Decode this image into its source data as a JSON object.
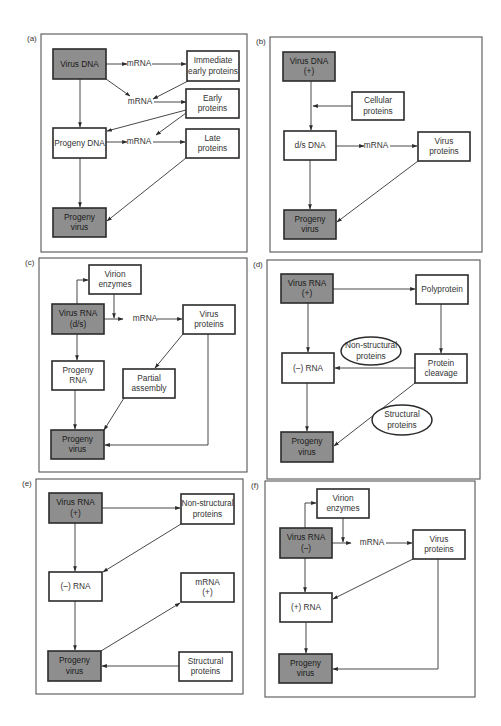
{
  "figure": {
    "colors": {
      "shaded_box": "#8e8e8e",
      "plain_box": "#ffffff",
      "stroke": "#2b2b2b"
    }
  },
  "panels": [
    {
      "id": "a",
      "tag": "(a)",
      "frame": [
        41,
        34,
        206,
        218
      ],
      "nodes": [
        {
          "id": "vdna",
          "type": "shaded",
          "x": 53,
          "y": 49,
          "w": 53,
          "h": 30,
          "lines": [
            "Virus DNA"
          ]
        },
        {
          "id": "m1",
          "type": "text",
          "x": 139,
          "y": 64,
          "lines": [
            "mRNA"
          ]
        },
        {
          "id": "iep",
          "type": "plain",
          "x": 187,
          "y": 51,
          "w": 52,
          "h": 30,
          "lines": [
            "Immediate",
            "early proteins"
          ]
        },
        {
          "id": "m2",
          "type": "text",
          "x": 140,
          "y": 102,
          "lines": [
            "mRNA"
          ]
        },
        {
          "id": "ep",
          "type": "plain",
          "x": 186,
          "y": 89,
          "w": 53,
          "h": 29,
          "lines": [
            "Early",
            "proteins"
          ]
        },
        {
          "id": "pdna",
          "type": "plain",
          "x": 53,
          "y": 128,
          "w": 53,
          "h": 30,
          "lines": [
            "Progeny DNA"
          ]
        },
        {
          "id": "m3",
          "type": "text",
          "x": 139,
          "y": 142,
          "lines": [
            "mRNA"
          ]
        },
        {
          "id": "lp",
          "type": "plain",
          "x": 186,
          "y": 129,
          "w": 53,
          "h": 29,
          "lines": [
            "Late",
            "proteins"
          ]
        },
        {
          "id": "pv",
          "type": "shaded",
          "x": 53,
          "y": 208,
          "w": 53,
          "h": 29,
          "lines": [
            "Progeny",
            "virus"
          ]
        }
      ],
      "edges": [
        [
          [
            106,
            64
          ],
          [
            127,
            64
          ]
        ],
        [
          [
            152,
            64
          ],
          [
            186,
            64
          ]
        ],
        [
          [
            106,
            79
          ],
          [
            130,
            96
          ]
        ],
        [
          [
            188,
            81
          ],
          [
            153,
            99
          ]
        ],
        [
          [
            154,
            102
          ],
          [
            186,
            102
          ]
        ],
        [
          [
            186,
            110
          ],
          [
            107,
            131
          ]
        ],
        [
          [
            186,
            113
          ],
          [
            156,
            135
          ]
        ],
        [
          [
            80,
            79
          ],
          [
            80,
            127
          ]
        ],
        [
          [
            106,
            142
          ],
          [
            127,
            142
          ]
        ],
        [
          [
            153,
            142
          ],
          [
            185,
            142
          ]
        ],
        [
          [
            80,
            158
          ],
          [
            80,
            207
          ]
        ],
        [
          [
            186,
            158
          ],
          [
            107,
            221
          ]
        ]
      ]
    },
    {
      "id": "b",
      "tag": "(b)",
      "frame": [
        270,
        37,
        212,
        215
      ],
      "nodes": [
        {
          "id": "vdna",
          "type": "shaded",
          "x": 283,
          "y": 52,
          "w": 52,
          "h": 29,
          "lines": [
            "Virus DNA",
            "(+)"
          ]
        },
        {
          "id": "cp",
          "type": "plain",
          "x": 352,
          "y": 92,
          "w": 52,
          "h": 28,
          "lines": [
            "Cellular",
            "proteins"
          ]
        },
        {
          "id": "dsdna",
          "type": "plain",
          "x": 284,
          "y": 131,
          "w": 52,
          "h": 29,
          "lines": [
            "d/s DNA"
          ]
        },
        {
          "id": "m1",
          "type": "text",
          "x": 376,
          "y": 146,
          "lines": [
            "mRNA"
          ]
        },
        {
          "id": "vp",
          "type": "plain",
          "x": 418,
          "y": 132,
          "w": 52,
          "h": 29,
          "lines": [
            "Virus",
            "proteins"
          ]
        },
        {
          "id": "pv",
          "type": "shaded",
          "x": 284,
          "y": 210,
          "w": 52,
          "h": 29,
          "lines": [
            "Progeny",
            "virus"
          ]
        }
      ],
      "edges": [
        [
          [
            311,
            81
          ],
          [
            311,
            130
          ]
        ],
        [
          [
            352,
            106
          ],
          [
            313,
            106
          ]
        ],
        [
          [
            336,
            146
          ],
          [
            364,
            146
          ]
        ],
        [
          [
            390,
            146
          ],
          [
            417,
            146
          ]
        ],
        [
          [
            310,
            160
          ],
          [
            310,
            209
          ]
        ],
        [
          [
            418,
            161
          ],
          [
            337,
            222
          ]
        ]
      ]
    },
    {
      "id": "c",
      "tag": "(c)",
      "frame": [
        39,
        258,
        208,
        214
      ],
      "nodes": [
        {
          "id": "ve",
          "type": "plain",
          "x": 89,
          "y": 265,
          "w": 52,
          "h": 29,
          "lines": [
            "Virion",
            "enzymes"
          ]
        },
        {
          "id": "vrna",
          "type": "shaded",
          "x": 52,
          "y": 304,
          "w": 52,
          "h": 30,
          "lines": [
            "Virus RNA",
            "(d/s)"
          ]
        },
        {
          "id": "m1",
          "type": "text",
          "x": 145,
          "y": 319,
          "lines": [
            "mRNA"
          ]
        },
        {
          "id": "vp",
          "type": "plain",
          "x": 183,
          "y": 305,
          "w": 52,
          "h": 29,
          "lines": [
            "Virus",
            "proteins"
          ]
        },
        {
          "id": "prna",
          "type": "plain",
          "x": 52,
          "y": 361,
          "w": 52,
          "h": 29,
          "lines": [
            "Progeny",
            "RNA"
          ]
        },
        {
          "id": "pa",
          "type": "plain",
          "x": 123,
          "y": 369,
          "w": 52,
          "h": 29,
          "lines": [
            "Partial",
            "assembly"
          ]
        },
        {
          "id": "pv",
          "type": "shaded",
          "x": 51,
          "y": 430,
          "w": 53,
          "h": 29,
          "lines": [
            "Progeny",
            "virus"
          ]
        }
      ],
      "edges": [
        [
          [
            77,
            304
          ],
          [
            77,
            280
          ],
          [
            88,
            280
          ]
        ],
        [
          [
            114,
            294
          ],
          [
            114,
            318
          ]
        ],
        [
          [
            104,
            319
          ],
          [
            123,
            319
          ]
        ],
        [
          [
            157,
            319
          ],
          [
            182,
            319
          ]
        ],
        [
          [
            77,
            334
          ],
          [
            77,
            360
          ]
        ],
        [
          [
            183,
            334
          ],
          [
            155,
            368
          ]
        ],
        [
          [
            75,
            390
          ],
          [
            75,
            429
          ]
        ],
        [
          [
            124,
            398
          ],
          [
            104,
            430
          ]
        ],
        [
          [
            208,
            334
          ],
          [
            208,
            445
          ],
          [
            105,
            445
          ]
        ]
      ]
    },
    {
      "id": "d",
      "tag": "(d)",
      "frame": [
        267,
        260,
        213,
        219
      ],
      "nodes": [
        {
          "id": "vrna",
          "type": "shaded",
          "x": 281,
          "y": 274,
          "w": 52,
          "h": 29,
          "lines": [
            "Virus RNA",
            "(+)"
          ]
        },
        {
          "id": "pp",
          "type": "plain",
          "x": 416,
          "y": 275,
          "w": 52,
          "h": 29,
          "lines": [
            "Polyprotein"
          ]
        },
        {
          "id": "nsp",
          "type": "ellipse",
          "cx": 371,
          "cy": 351,
          "rx": 30,
          "ry": 14,
          "lines": [
            "Non-structural",
            "proteins"
          ]
        },
        {
          "id": "mrna",
          "type": "plain",
          "x": 282,
          "y": 353,
          "w": 52,
          "h": 30,
          "lines": [
            "(–) RNA"
          ]
        },
        {
          "id": "pc",
          "type": "plain",
          "x": 415,
          "y": 354,
          "w": 52,
          "h": 29,
          "lines": [
            "Protein",
            "cleavage"
          ]
        },
        {
          "id": "sp",
          "type": "ellipse",
          "cx": 402,
          "cy": 420,
          "rx": 30,
          "ry": 15,
          "lines": [
            "Structural",
            "proteins"
          ]
        },
        {
          "id": "pv",
          "type": "shaded",
          "x": 281,
          "y": 432,
          "w": 52,
          "h": 30,
          "lines": [
            "Progeny",
            "virus"
          ]
        }
      ],
      "edges": [
        [
          [
            333,
            289
          ],
          [
            415,
            289
          ]
        ],
        [
          [
            441,
            304
          ],
          [
            441,
            353
          ]
        ],
        [
          [
            415,
            368
          ],
          [
            335,
            368
          ]
        ],
        [
          [
            308,
            303
          ],
          [
            308,
            352
          ]
        ],
        [
          [
            307,
            383
          ],
          [
            307,
            431
          ]
        ],
        [
          [
            415,
            383
          ],
          [
            334,
            446
          ]
        ]
      ]
    },
    {
      "id": "e",
      "tag": "(e)",
      "frame": [
        36,
        479,
        207,
        215
      ],
      "nodes": [
        {
          "id": "vrna",
          "type": "shaded",
          "x": 49,
          "y": 493,
          "w": 53,
          "h": 30,
          "lines": [
            "Virus RNA",
            "(+)"
          ]
        },
        {
          "id": "nsp",
          "type": "plain",
          "x": 181,
          "y": 494,
          "w": 53,
          "h": 30,
          "lines": [
            "Non-structural",
            "proteins"
          ]
        },
        {
          "id": "mrna",
          "type": "plain",
          "x": 49,
          "y": 572,
          "w": 53,
          "h": 29,
          "lines": [
            "(–) RNA"
          ]
        },
        {
          "id": "mrnap",
          "type": "plain",
          "x": 181,
          "y": 573,
          "w": 53,
          "h": 29,
          "lines": [
            "mRNA",
            "(+)"
          ]
        },
        {
          "id": "pv",
          "type": "shaded",
          "x": 48,
          "y": 651,
          "w": 53,
          "h": 30,
          "lines": [
            "Progeny",
            "virus"
          ]
        },
        {
          "id": "sp",
          "type": "plain",
          "x": 179,
          "y": 652,
          "w": 53,
          "h": 29,
          "lines": [
            "Structural",
            "proteins"
          ]
        }
      ],
      "edges": [
        [
          [
            102,
            508
          ],
          [
            180,
            508
          ]
        ],
        [
          [
            75,
            523
          ],
          [
            75,
            571
          ]
        ],
        [
          [
            181,
            524
          ],
          [
            103,
            572
          ]
        ],
        [
          [
            75,
            601
          ],
          [
            75,
            650
          ]
        ],
        [
          [
            101,
            651
          ],
          [
            180,
            603
          ]
        ],
        [
          [
            179,
            666
          ],
          [
            102,
            666
          ]
        ]
      ]
    },
    {
      "id": "f",
      "tag": "(f)",
      "frame": [
        265,
        481,
        210,
        216
      ],
      "nodes": [
        {
          "id": "ve",
          "type": "plain",
          "x": 317,
          "y": 489,
          "w": 52,
          "h": 29,
          "lines": [
            "Virion",
            "enzymes"
          ]
        },
        {
          "id": "vrna",
          "type": "shaded",
          "x": 280,
          "y": 528,
          "w": 52,
          "h": 30,
          "lines": [
            "Virus RNA",
            "(–)"
          ]
        },
        {
          "id": "m1",
          "type": "text",
          "x": 372,
          "y": 543,
          "lines": [
            "mRNA"
          ]
        },
        {
          "id": "vp",
          "type": "plain",
          "x": 413,
          "y": 530,
          "w": 52,
          "h": 29,
          "lines": [
            "Virus",
            "proteins"
          ]
        },
        {
          "id": "prna",
          "type": "plain",
          "x": 280,
          "y": 593,
          "w": 52,
          "h": 29,
          "lines": [
            "(+) RNA"
          ]
        },
        {
          "id": "pv",
          "type": "shaded",
          "x": 279,
          "y": 654,
          "w": 53,
          "h": 29,
          "lines": [
            "Progeny",
            "virus"
          ]
        }
      ],
      "edges": [
        [
          [
            305,
            528
          ],
          [
            305,
            503
          ],
          [
            316,
            503
          ]
        ],
        [
          [
            343,
            518
          ],
          [
            343,
            542
          ]
        ],
        [
          [
            332,
            543
          ],
          [
            351,
            543
          ]
        ],
        [
          [
            386,
            543
          ],
          [
            412,
            543
          ]
        ],
        [
          [
            305,
            558
          ],
          [
            305,
            592
          ]
        ],
        [
          [
            413,
            559
          ],
          [
            333,
            599
          ]
        ],
        [
          [
            306,
            622
          ],
          [
            306,
            653
          ]
        ],
        [
          [
            438,
            559
          ],
          [
            438,
            669
          ],
          [
            333,
            669
          ]
        ]
      ]
    }
  ]
}
